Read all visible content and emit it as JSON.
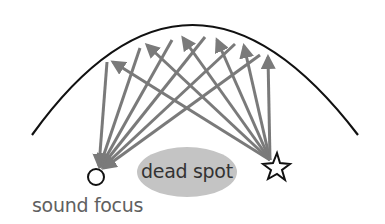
{
  "diagram": {
    "labels": {
      "dead_spot": "dead spot",
      "sound_focus": "sound focus"
    },
    "colors": {
      "arrow": "#7a7a7a",
      "dome": "#111111",
      "dead_spot_fill": "#c4c4c4",
      "marker_stroke": "#111111",
      "text": "#5a5a5a"
    },
    "dome": {
      "left": [
        32,
        135
      ],
      "top": [
        190,
        26
      ],
      "right": [
        358,
        135
      ]
    },
    "source_star": {
      "x": 272,
      "y": 165
    },
    "sound_focus_circle": {
      "x": 96,
      "y": 177,
      "r": 8
    },
    "dead_spot_ellipse": {
      "cx": 187,
      "cy": 172,
      "rx": 50,
      "ry": 25
    },
    "rays": [
      {
        "from": [
          272,
          160
        ],
        "to": [
          113,
          62
        ],
        "reflect_to": [
          98,
          168
        ]
      },
      {
        "from": [
          272,
          160
        ],
        "to": [
          147,
          45
        ],
        "reflect_to": [
          98,
          168
        ]
      },
      {
        "from": [
          272,
          160
        ],
        "to": [
          183,
          38
        ],
        "reflect_to": [
          98,
          168
        ]
      },
      {
        "from": [
          272,
          160
        ],
        "to": [
          217,
          40
        ],
        "reflect_to": [
          98,
          168
        ]
      },
      {
        "from": [
          272,
          160
        ],
        "to": [
          244,
          46
        ],
        "reflect_to": [
          98,
          168
        ]
      },
      {
        "from": [
          272,
          160
        ],
        "to": [
          268,
          57
        ],
        "reflect_to": [
          98,
          168
        ]
      }
    ],
    "return_lines": [
      {
        "from": [
          107,
          62
        ],
        "to": [
          98,
          168
        ]
      },
      {
        "from": [
          140,
          48
        ],
        "to": [
          98,
          168
        ]
      },
      {
        "from": [
          172,
          40
        ],
        "to": [
          98,
          168
        ]
      },
      {
        "from": [
          205,
          37
        ],
        "to": [
          98,
          168
        ]
      },
      {
        "from": [
          235,
          44
        ],
        "to": [
          98,
          168
        ]
      },
      {
        "from": [
          260,
          55
        ],
        "to": [
          98,
          168
        ]
      }
    ]
  }
}
